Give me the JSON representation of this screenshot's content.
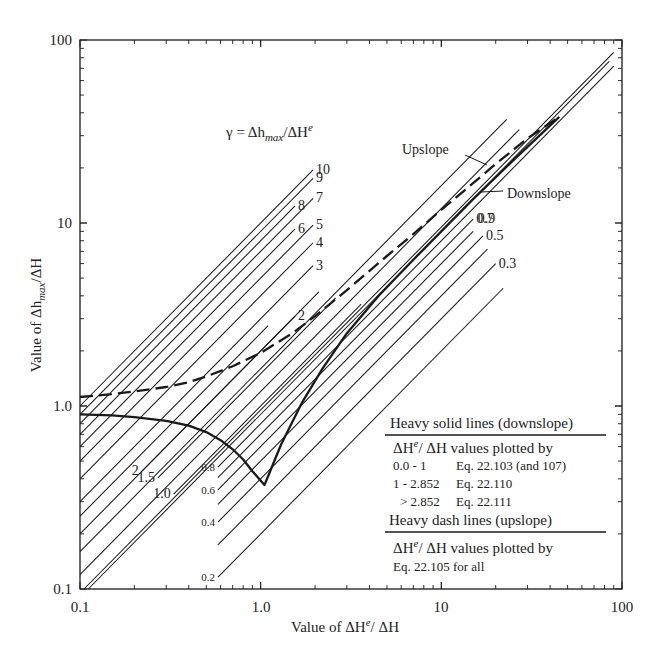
{
  "chart_data": {
    "type": "line",
    "title": "",
    "xlabel": "Value of ΔH^e/ ΔH",
    "ylabel": "Value of Δh_max/ΔH",
    "xscale": "log",
    "yscale": "log",
    "xlim": [
      0.1,
      100
    ],
    "ylim": [
      0.1,
      100
    ],
    "x_ticks": [
      "0.1",
      "1.0",
      "10",
      "100"
    ],
    "y_ticks": [
      "0.1",
      "1.0",
      "10",
      "100"
    ],
    "grid": false,
    "gamma_label": "γ = Δh_max/ΔH^e",
    "gamma_lines": [
      {
        "gamma": 10,
        "label": "10",
        "x_start": 0.1,
        "x_end": 1.95
      },
      {
        "gamma": 9,
        "label": "9",
        "x_start": 0.1,
        "x_end": 1.95
      },
      {
        "gamma": 8,
        "label": "8",
        "x_start": 0.1,
        "x_end": 1.55
      },
      {
        "gamma": 7,
        "label": "7",
        "x_start": 0.1,
        "x_end": 1.95
      },
      {
        "gamma": 6,
        "label": "6",
        "x_start": 0.1,
        "x_end": 1.55
      },
      {
        "gamma": 5,
        "label": "5",
        "x_start": 0.1,
        "x_end": 1.95
      },
      {
        "gamma": 4,
        "label": "4",
        "x_start": 0.1,
        "x_end": 1.95
      },
      {
        "gamma": 3,
        "label": "3",
        "x_start": 0.1,
        "x_end": 1.95
      },
      {
        "gamma": 2,
        "label": "2",
        "x_start": 0.1,
        "x_end": 1.55
      },
      {
        "gamma": 2,
        "label": "2",
        "x_start": 0.22,
        "x_end": 2.1,
        "label_pos": "start"
      },
      {
        "gamma": 1.5,
        "label": "1.5",
        "x_start": 0.27,
        "x_end": 2.6,
        "label_pos": "start"
      },
      {
        "gamma": 1.0,
        "label": "1.0",
        "x_start": 0.33,
        "x_end": 3.6,
        "label_pos": "start"
      },
      {
        "gamma": 0.9,
        "label": "0.9",
        "x_start": 0.1,
        "x_end": 85,
        "label_at": 12
      },
      {
        "gamma": 0.8,
        "label": "0.8",
        "x_start": 0.58,
        "x_end": 90,
        "label_pos": "start"
      },
      {
        "gamma": 0.7,
        "label": "0.7",
        "x_start": 0.58,
        "x_end": 15
      },
      {
        "gamma": 0.6,
        "label": "0.6",
        "x_start": 0.58,
        "x_end": 15,
        "label_pos": "start"
      },
      {
        "gamma": 0.5,
        "label": "0.5",
        "x_start": 0.58,
        "x_end": 17
      },
      {
        "gamma": 0.4,
        "label": "0.4",
        "x_start": 0.58,
        "x_end": 18,
        "label_pos": "start"
      },
      {
        "gamma": 0.3,
        "label": "0.3",
        "x_start": 0.58,
        "x_end": 20
      },
      {
        "gamma": 0.2,
        "label": "0.2",
        "x_start": 0.58,
        "x_end": 22,
        "label_pos": "start"
      }
    ],
    "extra_thin_lines": [
      {
        "gamma": 2.5,
        "x_start": 0.1,
        "x_end": 1.1
      },
      {
        "gamma": 1.6,
        "x_start": 0.1,
        "x_end": 23
      },
      {
        "gamma": 1.2,
        "x_start": 0.1,
        "x_end": 27
      },
      {
        "gamma": 0.95,
        "x_start": 0.1,
        "x_end": 90
      }
    ],
    "series": [
      {
        "name": "Heavy solid lines (downslope)",
        "style": "solid-heavy",
        "x": [
          0.1,
          0.15,
          0.2,
          0.3,
          0.4,
          0.5,
          0.6,
          0.7,
          0.8,
          0.9,
          1.05,
          1.3,
          1.7,
          2.2,
          3.0,
          4.5,
          7,
          10,
          15,
          25,
          45
        ],
        "y": [
          0.9,
          0.89,
          0.87,
          0.83,
          0.78,
          0.72,
          0.65,
          0.58,
          0.51,
          0.44,
          0.37,
          0.62,
          1.05,
          1.6,
          2.5,
          4.0,
          6.3,
          9.0,
          13.5,
          22,
          38
        ]
      },
      {
        "name": "Heavy dash lines (upslope)",
        "style": "dashed-heavy",
        "x": [
          0.1,
          0.15,
          0.2,
          0.3,
          0.4,
          0.5,
          0.7,
          1.0,
          1.5,
          2.0,
          3.0,
          5.0,
          7.0,
          10,
          15,
          20,
          30,
          45
        ],
        "y": [
          1.12,
          1.16,
          1.2,
          1.27,
          1.35,
          1.45,
          1.65,
          1.95,
          2.5,
          3.1,
          4.3,
          6.6,
          8.7,
          11.8,
          16.5,
          21,
          29,
          38
        ]
      }
    ],
    "annotations": [
      {
        "text": "Upslope",
        "x": 12,
        "y": 24
      },
      {
        "text": "Downslope",
        "x": 20,
        "y": 14
      }
    ],
    "legend": {
      "position": "lower-right",
      "solid_title": "Heavy solid lines (downslope)",
      "solid_sub": "ΔH^e/ ΔH values plotted by",
      "solid_rows": [
        {
          "range": "0.0 - 1",
          "eq": "Eq. 22.103 (and 107)"
        },
        {
          "range": "1 - 2.852",
          "eq": "Eq. 22.110"
        },
        {
          "range": "> 2.852",
          "eq": "Eq. 22.111"
        }
      ],
      "dash_title": "Heavy dash lines (upslope)",
      "dash_sub": "ΔH^e/ ΔH values plotted by",
      "dash_row": "Eq. 22.105 for all"
    }
  },
  "labels": {
    "x_tick_0": "0.1",
    "x_tick_1": "1.0",
    "x_tick_2": "10",
    "x_tick_3": "100",
    "y_tick_0": "0.1",
    "y_tick_1": "1.0",
    "y_tick_2": "10",
    "y_tick_3": "100",
    "xlabel_prefix": "Value of ΔH",
    "xlabel_sup": "e",
    "xlabel_suffix": "/ ΔH",
    "ylabel_prefix": "Value of Δh",
    "ylabel_sub": "max",
    "ylabel_suffix": "/ΔH",
    "gamma_prefix": "γ = Δh",
    "gamma_sub": "max",
    "gamma_mid": "/ΔH",
    "gamma_sup": "e",
    "upslope": "Upslope",
    "downslope": "Downslope",
    "legend_solid_title": "Heavy solid lines (downslope)",
    "legend_sub_prefix": "ΔH",
    "legend_sub_sup": "e",
    "legend_sub_suffix": "/ ΔH values plotted by",
    "legend_row1_range": "0.0 - 1",
    "legend_row1_eq": "Eq. 22.103 (and 107)",
    "legend_row2_range": "1 - 2.852",
    "legend_row2_eq": "Eq. 22.110",
    "legend_row3_range": "> 2.852",
    "legend_row3_eq": "Eq. 22.111",
    "legend_dash_title": "Heavy dash lines (upslope)",
    "legend_dash_row": "Eq. 22.105 for all"
  },
  "colors": {
    "ink": "#1a1a1a",
    "background": "#ffffff"
  }
}
